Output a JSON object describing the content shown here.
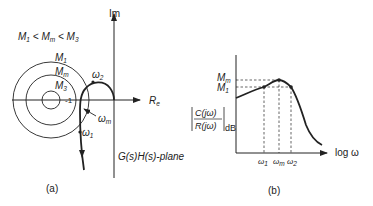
{
  "panel_a": {
    "caption": "(a)",
    "condition": {
      "m1": "M",
      "s1": "1",
      "lt1": "<",
      "mm": "M",
      "sm": "m",
      "lt2": "<",
      "m3": "M",
      "s3": "3"
    },
    "axis_im": "Im",
    "axis_re": {
      "main": "R",
      "sub": "e"
    },
    "circle_labels": {
      "m1": {
        "main": "M",
        "sub": "1"
      },
      "mm": {
        "main": "M",
        "sub": "m"
      },
      "m3": {
        "main": "M",
        "sub": "3"
      }
    },
    "center_label": "-1",
    "freq_labels": {
      "w2": {
        "main": "ω",
        "sub": "2"
      },
      "wm": {
        "main": "ω",
        "sub": "m"
      },
      "w1": {
        "main": "ω",
        "sub": "1"
      }
    },
    "plane_label": "G(s)H(s)-plane"
  },
  "panel_b": {
    "caption": "(b)",
    "y_ticks": {
      "mm": {
        "main": "M",
        "sub": "m"
      },
      "m1": {
        "main": "M",
        "sub": "1"
      }
    },
    "ylabel": {
      "num": "C(jω)",
      "den": "R(jω)",
      "unit": "dB"
    },
    "xlabel": "log ω",
    "x_ticks": {
      "w1": {
        "main": "ω",
        "sub": "1"
      },
      "wm": {
        "main": "ω",
        "sub": "m"
      },
      "w2": {
        "main": "ω",
        "sub": "2"
      }
    }
  }
}
